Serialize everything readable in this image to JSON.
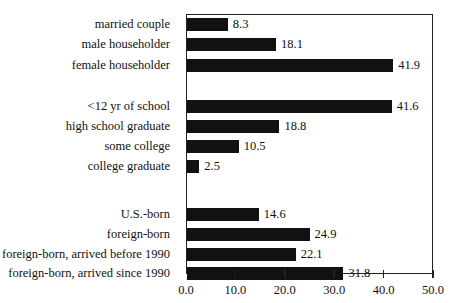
{
  "chart_data": {
    "type": "bar",
    "orientation": "horizontal",
    "title": "",
    "xlabel": "",
    "ylabel": "",
    "xlim": [
      0,
      50
    ],
    "x_ticks": [
      "0.0",
      "10.0",
      "20.0",
      "30.0",
      "40.0",
      "50.0"
    ],
    "grid": false,
    "legend": null,
    "groups": [
      {
        "name": "household type",
        "categories": [
          "married couple",
          "male householder",
          "female householder"
        ],
        "values": [
          8.3,
          18.1,
          41.9
        ]
      },
      {
        "name": "education",
        "categories": [
          "<12 yr of school",
          "high school graduate",
          "some college",
          "college graduate"
        ],
        "values": [
          41.6,
          18.8,
          10.5,
          2.5
        ]
      },
      {
        "name": "nativity",
        "categories": [
          "U.S.-born",
          "foreign-born",
          "foreign-born, arrived before 1990",
          "foreign-born, arrived since 1990"
        ],
        "values": [
          14.6,
          24.9,
          22.1,
          31.8
        ]
      }
    ],
    "categories": [
      "married couple",
      "male householder",
      "female householder",
      "<12 yr of school",
      "high school graduate",
      "some college",
      "college graduate",
      "U.S.-born",
      "foreign-born",
      "foreign-born, arrived before 1990",
      "foreign-born, arrived since 1990"
    ],
    "values": [
      8.3,
      18.1,
      41.9,
      41.6,
      18.8,
      10.5,
      2.5,
      14.6,
      24.9,
      22.1,
      31.8
    ],
    "value_labels": [
      "8.3",
      "18.1",
      "41.9",
      "41.6",
      "18.8",
      "10.5",
      "2.5",
      "14.6",
      "24.9",
      "22.1",
      "31.8"
    ],
    "bar_color": "#111111"
  }
}
